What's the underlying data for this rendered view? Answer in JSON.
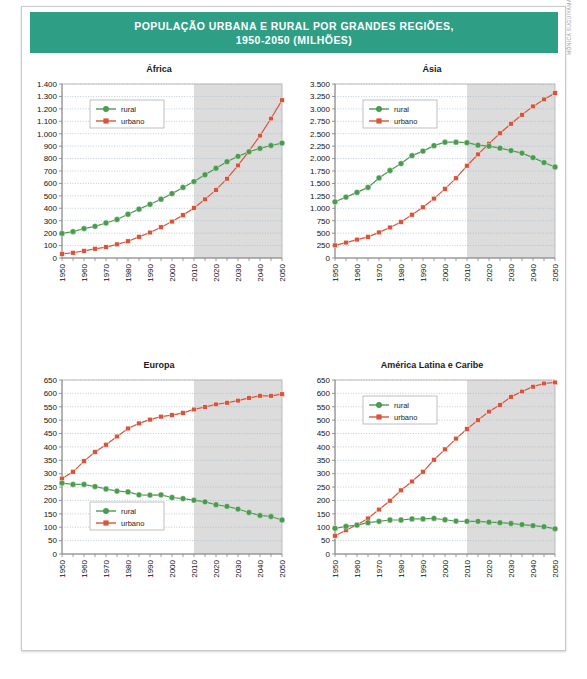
{
  "header": {
    "title": "POPULAÇÃO URBANA E RURAL POR GRANDES REGIÕES,\n1950-2050 (MILHÕES)",
    "band_color": "#2e9e85"
  },
  "credit": {
    "text": "MÔNICA SUGUIYAMA/ACERVO DA EDITORA"
  },
  "colors": {
    "rural": "#4a9b4e",
    "urbano": "#d9543a",
    "projection_shade": "#dcdcdc",
    "grid": "#9fb7c9",
    "axis": "#9a9a9a"
  },
  "legend": {
    "rural": "rural",
    "urbano": "urbano"
  },
  "chart_data": [
    {
      "type": "line",
      "title": "África",
      "xlabel": "",
      "ylabel": "",
      "x": [
        1950,
        1955,
        1960,
        1965,
        1970,
        1975,
        1980,
        1985,
        1990,
        1995,
        2000,
        2005,
        2010,
        2015,
        2020,
        2025,
        2030,
        2035,
        2040,
        2045,
        2050
      ],
      "tick_labels_x": [
        "1950",
        "1960",
        "1970",
        "1980",
        "1990",
        "2000",
        "2010",
        "2020",
        "2030",
        "2040",
        "2050"
      ],
      "ticks_y": [
        0,
        100,
        200,
        300,
        400,
        500,
        600,
        700,
        800,
        900,
        1000,
        1100,
        1200,
        1300,
        1400
      ],
      "tick_labels_y": [
        "0",
        "100",
        "200",
        "300",
        "400",
        "500",
        "600",
        "700",
        "800",
        "900",
        "1.000",
        "1.100",
        "1.200",
        "1.300",
        "1.400"
      ],
      "ylim": [
        0,
        1400
      ],
      "grid": true,
      "legend_position": "top-left",
      "projection_from": 2010,
      "series": [
        {
          "name": "rural",
          "values": [
            198,
            212,
            237,
            255,
            282,
            310,
            352,
            393,
            432,
            473,
            518,
            568,
            615,
            670,
            722,
            775,
            818,
            855,
            882,
            905,
            925
          ]
        },
        {
          "name": "urbano",
          "values": [
            33,
            42,
            57,
            74,
            88,
            110,
            135,
            170,
            205,
            248,
            293,
            345,
            403,
            472,
            548,
            638,
            745,
            860,
            985,
            1122,
            1270
          ]
        }
      ]
    },
    {
      "type": "line",
      "title": "Ásia",
      "xlabel": "",
      "ylabel": "",
      "x": [
        1950,
        1955,
        1960,
        1965,
        1970,
        1975,
        1980,
        1985,
        1990,
        1995,
        2000,
        2005,
        2010,
        2015,
        2020,
        2025,
        2030,
        2035,
        2040,
        2045,
        2050
      ],
      "tick_labels_x": [
        "1950",
        "1960",
        "1970",
        "1980",
        "1990",
        "2000",
        "2010",
        "2020",
        "2030",
        "2040",
        "2050"
      ],
      "ticks_y": [
        0,
        250,
        500,
        750,
        1000,
        1250,
        1500,
        1750,
        2000,
        2250,
        2500,
        2750,
        3000,
        3250,
        3500
      ],
      "tick_labels_y": [
        "0",
        "250",
        "500",
        "750",
        "1.000",
        "1.250",
        "1.500",
        "1.750",
        "2.000",
        "2.250",
        "2.500",
        "2.750",
        "3.000",
        "3.250",
        "3.500"
      ],
      "ylim": [
        0,
        3500
      ],
      "grid": true,
      "legend_position": "top-left",
      "projection_from": 2010,
      "series": [
        {
          "name": "rural",
          "values": [
            1130,
            1225,
            1320,
            1420,
            1610,
            1760,
            1900,
            2060,
            2150,
            2260,
            2330,
            2330,
            2320,
            2270,
            2250,
            2210,
            2160,
            2110,
            2020,
            1920,
            1830
          ]
        },
        {
          "name": "urbano",
          "values": [
            255,
            310,
            370,
            425,
            515,
            615,
            725,
            870,
            1020,
            1195,
            1390,
            1605,
            1855,
            2085,
            2300,
            2510,
            2700,
            2880,
            3050,
            3190,
            3320
          ]
        }
      ]
    },
    {
      "type": "line",
      "title": "Europa",
      "xlabel": "",
      "ylabel": "",
      "x": [
        1950,
        1955,
        1960,
        1965,
        1970,
        1975,
        1980,
        1985,
        1990,
        1995,
        2000,
        2005,
        2010,
        2015,
        2020,
        2025,
        2030,
        2035,
        2040,
        2045,
        2050
      ],
      "tick_labels_x": [
        "1950",
        "1960",
        "1970",
        "1980",
        "1990",
        "2000",
        "2010",
        "2020",
        "2030",
        "2040",
        "2050"
      ],
      "ticks_y": [
        0,
        50,
        100,
        150,
        200,
        250,
        300,
        350,
        400,
        450,
        500,
        550,
        600,
        650
      ],
      "tick_labels_y": [
        "0",
        "50",
        "100",
        "150",
        "200",
        "250",
        "300",
        "350",
        "400",
        "450",
        "500",
        "550",
        "600",
        "650"
      ],
      "ylim": [
        0,
        650
      ],
      "grid": true,
      "legend_position": "bottom-left",
      "projection_from": 2010,
      "series": [
        {
          "name": "rural",
          "values": [
            265,
            260,
            260,
            252,
            243,
            235,
            232,
            221,
            220,
            221,
            211,
            207,
            201,
            195,
            184,
            178,
            168,
            155,
            144,
            140,
            127
          ]
        },
        {
          "name": "urbano",
          "values": [
            282,
            307,
            347,
            381,
            408,
            439,
            469,
            488,
            502,
            513,
            519,
            527,
            540,
            549,
            559,
            565,
            573,
            583,
            591,
            591,
            597
          ]
        }
      ]
    },
    {
      "type": "line",
      "title": "América Latina e Caribe",
      "xlabel": "",
      "ylabel": "",
      "x": [
        1950,
        1955,
        1960,
        1965,
        1970,
        1975,
        1980,
        1985,
        1990,
        1995,
        2000,
        2005,
        2010,
        2015,
        2020,
        2025,
        2030,
        2035,
        2040,
        2045,
        2050
      ],
      "tick_labels_x": [
        "1950",
        "1960",
        "1970",
        "1980",
        "1990",
        "2000",
        "2010",
        "2020",
        "2030",
        "2040",
        "2050"
      ],
      "ticks_y": [
        0,
        50,
        100,
        150,
        200,
        250,
        300,
        350,
        400,
        450,
        500,
        550,
        600,
        650
      ],
      "tick_labels_y": [
        "0",
        "50",
        "100",
        "150",
        "200",
        "250",
        "300",
        "350",
        "400",
        "450",
        "500",
        "550",
        "600",
        "650"
      ],
      "ylim": [
        0,
        650
      ],
      "grid": true,
      "legend_position": "top-left",
      "projection_from": 2010,
      "series": [
        {
          "name": "rural",
          "values": [
            96,
            103,
            108,
            117,
            122,
            127,
            127,
            131,
            131,
            133,
            128,
            123,
            122,
            122,
            119,
            117,
            114,
            110,
            106,
            102,
            94
          ]
        },
        {
          "name": "urbano",
          "values": [
            68,
            89,
            109,
            133,
            166,
            199,
            238,
            271,
            307,
            352,
            391,
            431,
            467,
            500,
            532,
            557,
            587,
            607,
            625,
            637,
            641
          ]
        }
      ]
    }
  ]
}
